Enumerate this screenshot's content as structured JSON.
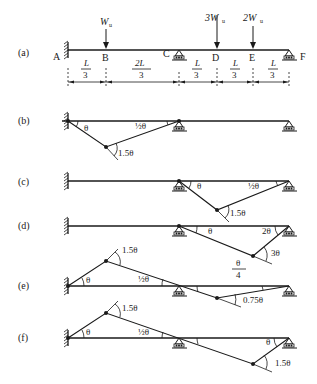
{
  "figure": {
    "panel_a": {
      "label": "(a)",
      "nodes": [
        "A",
        "B",
        "C",
        "D",
        "E",
        "F"
      ],
      "loads": [
        {
          "at": "B",
          "label": "W",
          "sub": "u"
        },
        {
          "at": "D",
          "label": "3W",
          "sub": "u"
        },
        {
          "at": "E",
          "label": "2W",
          "sub": "u"
        }
      ],
      "spans": [
        {
          "num": "L",
          "den": "3"
        },
        {
          "num": "2L",
          "den": "3"
        },
        {
          "num": "L",
          "den": "3"
        },
        {
          "num": "L",
          "den": "3"
        },
        {
          "num": "L",
          "den": "3"
        }
      ]
    },
    "panel_b": {
      "label": "(b)",
      "angle_left": "θ",
      "angle_right": "½θ",
      "hinge_angle": "1.5θ"
    },
    "panel_c": {
      "label": "(c)",
      "angle_left": "θ",
      "angle_right": "½θ",
      "hinge_angle": "1.5θ"
    },
    "panel_d": {
      "label": "(d)",
      "angle_left": "θ",
      "angle_right": "2θ",
      "hinge_angle": "3θ"
    },
    "panel_e": {
      "label": "(e)",
      "angle_left": "θ",
      "angle_mid": "½θ",
      "hinge_angle_up": "1.5θ",
      "frac_num": "θ",
      "frac_den": "4",
      "hinge_angle_down": "0.75θ"
    },
    "panel_f": {
      "label": "(f)",
      "angle_left": "θ",
      "angle_mid": "½θ",
      "hinge_angle_up": "1.5θ",
      "angle_right": "θ",
      "hinge_angle_down": "1.5θ"
    }
  }
}
